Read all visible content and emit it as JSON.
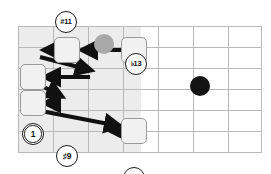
{
  "diagram": {
    "type": "guitar-fretboard-interval-diagram",
    "colors": {
      "grid": "#b9b9b9",
      "shade": "#ececec",
      "filled_note": "#131313",
      "grey_note": "#a8a8a8",
      "open_note_fill": "#ffffff",
      "open_note_stroke": "#1b1b1b",
      "boxed_highlight_fill": "#f1f1f1",
      "boxed_highlight_stroke": "#9a9a9a",
      "arrow": "#111111",
      "background": "#ffffff"
    },
    "grid": {
      "left": 18,
      "top": 26,
      "right": 262,
      "bottom": 152,
      "columns": 7,
      "rows": 6,
      "col_x": [
        18,
        53,
        88,
        123,
        158,
        193,
        228,
        262
      ],
      "row_y": [
        26,
        47,
        68,
        89,
        110,
        131,
        152
      ],
      "shaded_region": {
        "x": 18,
        "y": 26,
        "width": 123,
        "height": 126
      }
    },
    "markers": [
      {
        "id": "m1",
        "label": "#11",
        "style": "open",
        "boxed": false,
        "cx": 66,
        "cy": 22
      },
      {
        "id": "m2",
        "label": "",
        "style": "grey",
        "boxed": false,
        "cx": 104,
        "cy": 22
      },
      {
        "id": "m3",
        "label": "♭13",
        "style": "open",
        "boxed": false,
        "cx": 136,
        "cy": 22
      },
      {
        "id": "m4",
        "label": "",
        "style": "filled",
        "boxed": false,
        "cx": 200,
        "cy": 22
      },
      {
        "id": "m5",
        "label": "1",
        "style": "open",
        "boxed": false,
        "cx": 33,
        "cy": 50,
        "double": true
      },
      {
        "id": "m6",
        "label": "♯9",
        "style": "open",
        "boxed": true,
        "cx": 67,
        "cy": 50
      },
      {
        "id": "m7",
        "label": "♯9",
        "style": "open",
        "boxed": true,
        "cx": 134,
        "cy": 50
      },
      {
        "id": "m8",
        "label": "",
        "style": "filled",
        "boxed": false,
        "cx": 165,
        "cy": 52
      },
      {
        "id": "m9",
        "label": "m3",
        "style": "open",
        "boxed": true,
        "cx": 33,
        "cy": 77,
        "double": true
      },
      {
        "id": "m10",
        "label": "",
        "style": "filled",
        "boxed": false,
        "cx": 101,
        "cy": 77
      },
      {
        "id": "m11",
        "label": "1",
        "style": "open",
        "boxed": false,
        "cx": 166,
        "cy": 77,
        "double": true
      },
      {
        "id": "m12",
        "label": "♯9",
        "style": "open",
        "boxed": true,
        "cx": 33,
        "cy": 103
      },
      {
        "id": "m13",
        "label": "",
        "style": "filled",
        "boxed": false,
        "cx": 67,
        "cy": 103
      },
      {
        "id": "m14",
        "label": "#11",
        "style": "open",
        "boxed": false,
        "cx": 135,
        "cy": 102
      },
      {
        "id": "m15",
        "label": "",
        "style": "grey",
        "boxed": false,
        "cx": 166,
        "cy": 103
      },
      {
        "id": "m16",
        "label": "♭13",
        "style": "open",
        "boxed": false,
        "cx": 206,
        "cy": 102
      },
      {
        "id": "m17",
        "label": "5",
        "style": "open",
        "boxed": false,
        "cx": 102,
        "cy": 131
      },
      {
        "id": "m18",
        "label": "♭9",
        "style": "open",
        "boxed": true,
        "cx": 134,
        "cy": 131
      },
      {
        "id": "m19",
        "label": "♯9",
        "style": "open",
        "boxed": false,
        "cx": 206,
        "cy": 130
      }
    ],
    "arrows": [
      {
        "id": "a1",
        "from": "#9 (col4 row2)",
        "to": "#9 (col2 row2)",
        "x1": 122,
        "y1": 50,
        "x2": 81,
        "y2": 50
      },
      {
        "id": "a2",
        "from": "#9 (col2 row2)",
        "to": "1 (col1 row2)",
        "x1": 56,
        "y1": 50,
        "x2": 43,
        "y2": 50
      },
      {
        "id": "a3",
        "from": "1 (col1 row2)",
        "to": "black dot row3",
        "x1": 40,
        "y1": 56,
        "x2": 91,
        "y2": 70
      },
      {
        "id": "a4",
        "from": "black dot row3",
        "to": "m3 (col1 row3)",
        "x1": 90,
        "y1": 77,
        "x2": 44,
        "y2": 77
      },
      {
        "id": "a5",
        "from": "m3 (col1 row3)",
        "to": "black dot row4",
        "x1": 40,
        "y1": 84,
        "x2": 62,
        "y2": 96
      },
      {
        "id": "a6",
        "from": "black dot row4",
        "to": "#9 (col1 row4)",
        "x1": 57,
        "y1": 103,
        "x2": 44,
        "y2": 103
      },
      {
        "id": "a7",
        "from": "#9 (col1 row4)",
        "to": "♭9 (col4 row5)",
        "x1": 41,
        "y1": 110,
        "x2": 120,
        "y2": 126
      },
      {
        "id": "a8",
        "from": "♭9 (col4 row5)",
        "to": "5 (col3 row5)",
        "x1": 124,
        "y1": 131,
        "x2": 111,
        "y2": 131
      }
    ]
  }
}
